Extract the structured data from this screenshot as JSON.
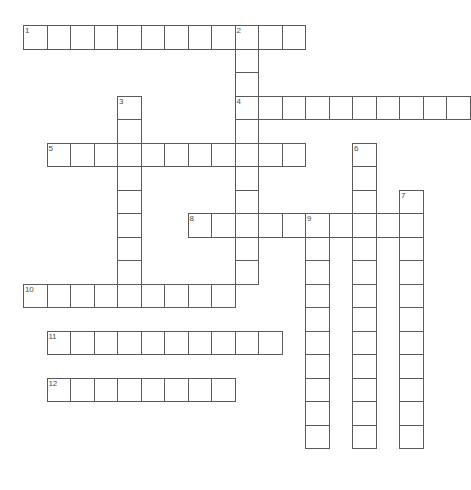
{
  "puzzle": {
    "title": "Crossword Grid",
    "type": "crossword",
    "background_color": "#ffffff",
    "cell_border_color": "#5a5a5a",
    "number_color": "#4a4a4a",
    "geometry": {
      "cell_size": 23.5,
      "origin_x": 23,
      "origin_y": 25,
      "columns": 19,
      "rows": 19
    },
    "entries": [
      {
        "number": "1",
        "direction": "across",
        "col": 0,
        "row": 0,
        "length": 12
      },
      {
        "number": "2",
        "direction": "down",
        "col": 9,
        "row": 0,
        "length": 11
      },
      {
        "number": "3",
        "direction": "down",
        "col": 4,
        "row": 3,
        "length": 8
      },
      {
        "number": "4",
        "direction": "across",
        "col": 9,
        "row": 3,
        "length": 10
      },
      {
        "number": "5",
        "direction": "across",
        "col": 1,
        "row": 5,
        "length": 11
      },
      {
        "number": "6",
        "direction": "down",
        "col": 14,
        "row": 5,
        "length": 13
      },
      {
        "number": "7",
        "direction": "down",
        "col": 16,
        "row": 7,
        "length": 11
      },
      {
        "number": "8",
        "direction": "across",
        "col": 7,
        "row": 8,
        "length": 10
      },
      {
        "number": "9",
        "direction": "down",
        "col": 12,
        "row": 8,
        "length": 10
      },
      {
        "number": "10",
        "direction": "across",
        "col": 0,
        "row": 11,
        "length": 9
      },
      {
        "number": "11",
        "direction": "across",
        "col": 1,
        "row": 13,
        "length": 10
      },
      {
        "number": "12",
        "direction": "across",
        "col": 1,
        "row": 15,
        "length": 8
      }
    ],
    "numbered_cells": [
      {
        "label": "1",
        "col": 0,
        "row": 0
      },
      {
        "label": "2",
        "col": 9,
        "row": 0
      },
      {
        "label": "3",
        "col": 4,
        "row": 3
      },
      {
        "label": "4",
        "col": 9,
        "row": 3
      },
      {
        "label": "5",
        "col": 1,
        "row": 5
      },
      {
        "label": "6",
        "col": 14,
        "row": 5
      },
      {
        "label": "7",
        "col": 16,
        "row": 7
      },
      {
        "label": "8",
        "col": 7,
        "row": 8
      },
      {
        "label": "9",
        "col": 12,
        "row": 8
      },
      {
        "label": "10",
        "col": 0,
        "row": 11
      },
      {
        "label": "11",
        "col": 1,
        "row": 13
      },
      {
        "label": "12",
        "col": 1,
        "row": 15
      }
    ]
  }
}
